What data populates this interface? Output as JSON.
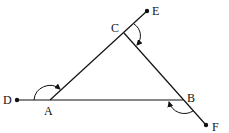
{
  "diagram": {
    "type": "geometry-triangle-exterior-angles",
    "line_color": "#111111",
    "points": {
      "D": {
        "label": "D",
        "x": 17,
        "y": 100,
        "endpoint": true
      },
      "A": {
        "label": "A",
        "x": 50,
        "y": 100,
        "endpoint": false
      },
      "B": {
        "label": "B",
        "x": 183,
        "y": 100,
        "endpoint": false
      },
      "C": {
        "label": "C",
        "x": 124,
        "y": 33,
        "endpoint": false
      },
      "E": {
        "label": "E",
        "x": 147,
        "y": 11,
        "endpoint": true
      },
      "F": {
        "label": "F",
        "x": 206,
        "y": 125,
        "endpoint": true
      }
    },
    "segments": [
      "D-B",
      "A-E",
      "C-F"
    ],
    "exterior_angles": [
      {
        "vertex": "A",
        "between": [
          "D",
          "C"
        ]
      },
      {
        "vertex": "C",
        "between": [
          "E",
          "B"
        ]
      },
      {
        "vertex": "B",
        "between": [
          "F",
          "A"
        ]
      }
    ]
  }
}
